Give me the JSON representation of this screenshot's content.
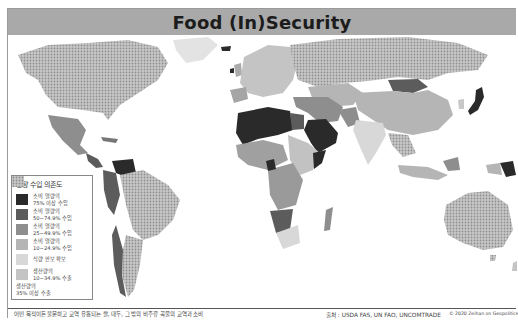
{
  "header": {
    "title": "Food (In)Security"
  },
  "legend": {
    "title": "열량 수입 의존도",
    "items": [
      {
        "label_line1": "소비 열량의",
        "label_line2": "75% 이상 수입",
        "color": "#2a2a2a",
        "pattern": "solid"
      },
      {
        "label_line1": "소비 열량의",
        "label_line2": "50~74.9% 수입",
        "color": "#5c5c5c",
        "pattern": "solid"
      },
      {
        "label_line1": "소비 열량의",
        "label_line2": "25~49.9% 수입",
        "color": "#8e8e8e",
        "pattern": "solid"
      },
      {
        "label_line1": "소비 열량의",
        "label_line2": "10~24.9% 수입",
        "color": "#b5b5b5",
        "pattern": "solid"
      },
      {
        "label_line1": "식량 안보 확보",
        "label_line2": "",
        "color": "#d8d8d8",
        "pattern": "solid"
      },
      {
        "label_line1": "생산량의",
        "label_line2": "10~34.9% 수출",
        "color": "#c4c4c4",
        "pattern": "solid"
      },
      {
        "label_line1": "생산량의",
        "label_line2": "35% 이상 수출",
        "color": "#b0b0b0",
        "pattern": "hatched"
      }
    ]
  },
  "footer": {
    "note": "어떤 목적이든 불문하고 교역 유통되는 쌀, 대두, 그 밖의 비주류 곡물의 교역과 소비",
    "source": "출처 : USDA FAS, UN FAO, UNCOMTRADE",
    "copyright": "© 2020 Zeihan on Geopolitics"
  },
  "colors": {
    "title_bar": "#a9a9a9",
    "level_75_plus": "#2a2a2a",
    "level_50_75": "#5c5c5c",
    "level_25_50": "#8e8e8e",
    "level_10_25": "#b5b5b5",
    "secure": "#d8d8d8",
    "export_10_35": "#c4c4c4",
    "export_35_plus": "#b0b0b0"
  },
  "map": {
    "regions": [
      {
        "name": "North America (US/Canada)",
        "category": "35% 이상 수출"
      },
      {
        "name": "Mexico",
        "category": "25~49.9% 수입"
      },
      {
        "name": "Venezuela",
        "category": "75% 이상 수입"
      },
      {
        "name": "Brazil/Argentina",
        "category": "35% 이상 수출"
      },
      {
        "name": "Russia",
        "category": "35% 이상 수출"
      },
      {
        "name": "Algeria/Libya/Saudi Arabia/Yemen",
        "category": "75% 이상 수입"
      },
      {
        "name": "Mongolia",
        "category": "50~74.9% 수입"
      },
      {
        "name": "Japan",
        "category": "75% 이상 수입"
      },
      {
        "name": "Australia",
        "category": "35% 이상 수출"
      },
      {
        "name": "Papua New Guinea",
        "category": "75% 이상 수입"
      },
      {
        "name": "China",
        "category": "10~24.9% 수입"
      },
      {
        "name": "India",
        "category": "식량 안보 확보"
      }
    ]
  }
}
